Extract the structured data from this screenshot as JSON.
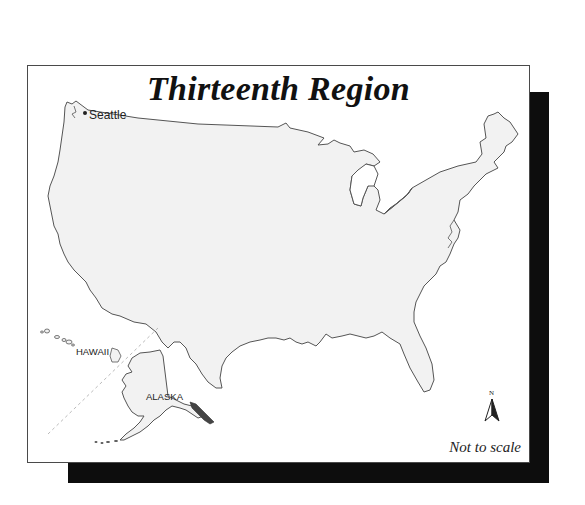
{
  "map": {
    "title": "Thirteenth Region",
    "labels": {
      "city": "Seattle",
      "hawaii": "HAWAII",
      "alaska": "ALASKA"
    },
    "scale_note": "Not to scale",
    "north_arrow": {
      "letter": "N",
      "icon": "north-arrow-icon"
    },
    "colors": {
      "land": "#f2f2f2",
      "outline": "#555555",
      "shadow": "#0d0d0d",
      "background": "#ffffff"
    }
  }
}
